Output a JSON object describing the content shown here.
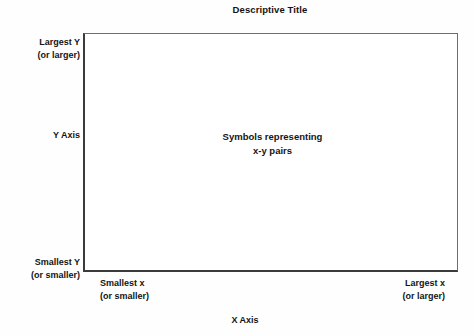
{
  "figure": {
    "title": "Descriptive Title",
    "background_color": "#fefefe",
    "plot_background_color": "#ffffff",
    "frame_color": "#6e6e6e",
    "frame_accent_color": "#3b3b3b",
    "text_color": "#141414"
  },
  "annotation": {
    "line1": "Symbols representing",
    "line2": "x-y pairs"
  },
  "y_axis": {
    "name": "Y Axis",
    "max_label": "Largest Y",
    "max_sub_label": "(or larger)",
    "min_label": "Smallest Y",
    "min_sub_label": "(or smaller)"
  },
  "x_axis": {
    "name": "X Axis",
    "min_label": "Smallest x",
    "min_sub_label": "(or smaller)",
    "max_label": "Largest x",
    "max_sub_label": "(or larger)"
  },
  "chart_data": {
    "type": "scatter",
    "title": "Descriptive Title",
    "xlabel": "X Axis",
    "ylabel": "Y Axis",
    "grid": false,
    "legend": false,
    "x": [],
    "y": [],
    "series": [
      {
        "name": "Symbols representing x-y pairs",
        "x": [],
        "y": []
      }
    ],
    "xlim": [
      "Smallest x (or smaller)",
      "Largest x (or larger)"
    ],
    "ylim": [
      "Smallest Y (or smaller)",
      "Largest Y (or larger)"
    ],
    "xtick_labels": [
      "Smallest x\n(or smaller)",
      "Largest x\n(or larger)"
    ],
    "ytick_labels": [
      "Smallest Y\n(or smaller)",
      "Largest Y\n(or larger)"
    ],
    "annotations": [
      "Symbols representing",
      "x-y pairs"
    ],
    "note": "Schematic template of an empty scatter plot; no data points are plotted."
  }
}
